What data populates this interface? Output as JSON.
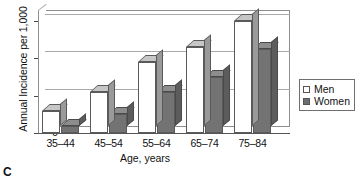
{
  "chart_data": {
    "type": "bar",
    "title": "",
    "xlabel": "Age, years",
    "ylabel": "Annual Incidence per 1,000",
    "categories": [
      "35–44",
      "45–54",
      "55–64",
      "65–74",
      "75–84"
    ],
    "series": [
      {
        "name": "Men",
        "values": [
          5.8,
          11.0,
          19.0,
          23.0,
          30.0
        ],
        "color": "#ffffff"
      },
      {
        "name": "Women",
        "values": [
          2.0,
          5.0,
          11.0,
          15.0,
          22.5
        ],
        "color": "#737373"
      }
    ],
    "ylim": [
      0,
      31
    ],
    "yticks": [
      0,
      10,
      20,
      30
    ],
    "ytick_labels": [
      "0",
      "10",
      "20",
      "30"
    ],
    "grid": true,
    "legend_position": "right",
    "style": "3d-columns"
  },
  "legend": {
    "entries": [
      {
        "label": "Men",
        "swatch": "hollow-square"
      },
      {
        "label": "Women",
        "swatch": "filled-square"
      }
    ]
  },
  "panel": {
    "letter": "C"
  },
  "colors": {
    "men_fill": "#ffffff",
    "women_fill": "#737373",
    "axis": "#555555",
    "grid": "#a9a9a9",
    "text": "#111111"
  }
}
